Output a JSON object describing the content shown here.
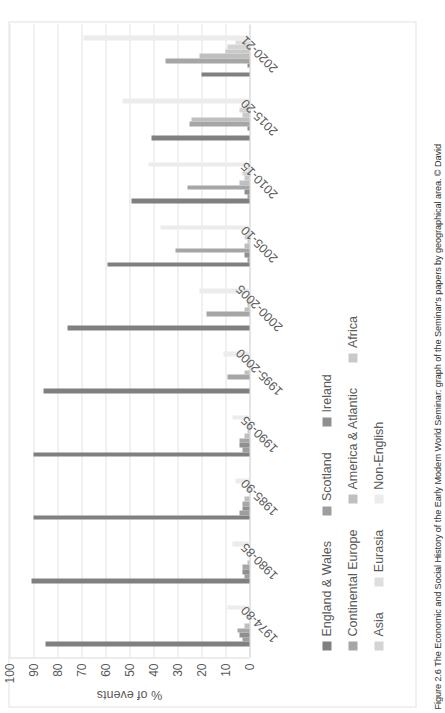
{
  "figure": {
    "caption": "Figure 2.6 The Economic and Social History of the Early Modern World Seminar: graph of the Seminar's papers by geographical area. © David"
  },
  "chart_data": {
    "type": "bar",
    "title": "",
    "xlabel": "",
    "ylabel": "% of events",
    "ylim": [
      0,
      100
    ],
    "yticks": [
      0,
      10,
      20,
      30,
      40,
      50,
      60,
      70,
      80,
      90,
      100
    ],
    "grid": true,
    "legend_position": "bottom",
    "orientation": "rotated-90-ccw",
    "categories": [
      "1974-80",
      "1980-85",
      "1985-90",
      "1990-95",
      "1995-2000",
      "2000-2005",
      "2005-10",
      "2010-15",
      "2015-20",
      "2020-21"
    ],
    "series": [
      {
        "name": "England & Wales",
        "color": "#808080",
        "values": [
          85,
          91,
          90,
          90,
          86,
          76,
          59,
          49,
          41,
          20
        ]
      },
      {
        "name": "Scotland",
        "color": "#9e9e9e",
        "values": [
          3,
          2,
          4,
          3,
          0,
          0,
          1,
          1,
          0,
          0
        ]
      },
      {
        "name": "Ireland",
        "color": "#8f8f8f",
        "values": [
          4,
          3,
          3,
          4,
          0,
          0,
          2,
          2,
          1,
          1
        ]
      },
      {
        "name": "Continental Europe",
        "color": "#a6a6a6",
        "values": [
          5,
          3,
          3,
          4,
          9,
          18,
          31,
          26,
          25,
          35
        ]
      },
      {
        "name": "America & Atlantic",
        "color": "#bfbfbf",
        "values": [
          2,
          1,
          2,
          2,
          2,
          2,
          2,
          4,
          24,
          21
        ]
      },
      {
        "name": "Africa",
        "color": "#c9c9c9",
        "values": [
          0,
          0,
          0,
          1,
          0,
          1,
          1,
          2,
          3,
          10
        ]
      },
      {
        "name": "Asia",
        "color": "#d4d4d4",
        "values": [
          1,
          0,
          1,
          1,
          1,
          1,
          2,
          3,
          4,
          9
        ]
      },
      {
        "name": "Eurasia",
        "color": "#dedede",
        "values": [
          0,
          0,
          0,
          0,
          0,
          0,
          1,
          1,
          2,
          6
        ]
      },
      {
        "name": "Non-English",
        "color": "#ececec",
        "values": [
          9,
          7,
          6,
          7,
          11,
          21,
          37,
          42,
          53,
          69
        ]
      }
    ]
  },
  "axis": {
    "y_title": "% of events",
    "y_tick_labels": [
      "100",
      "90",
      "80",
      "70",
      "60",
      "50",
      "40",
      "30",
      "20",
      "10",
      "0"
    ]
  },
  "legend": {
    "rows": [
      [
        "England & Wales",
        "Scotland",
        "Ireland"
      ],
      [
        "Continental Europe",
        "America & Atlantic",
        "Africa"
      ],
      [
        "Asia",
        "Eurasia",
        "Non-English"
      ]
    ]
  }
}
